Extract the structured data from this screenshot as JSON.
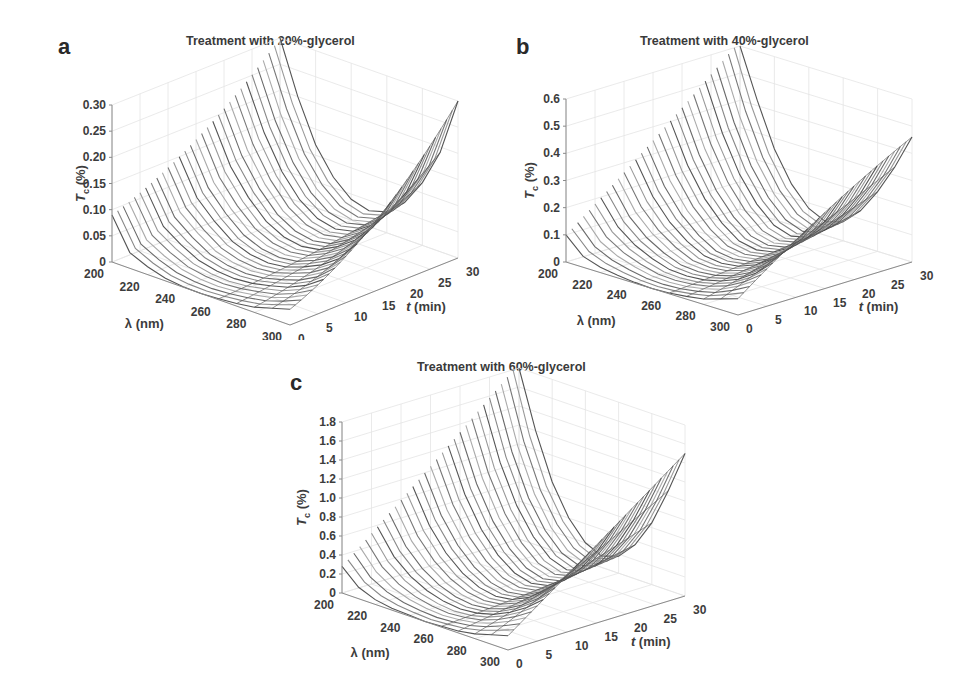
{
  "panels": [
    {
      "letter": "a",
      "title": "Treatment with 20%-glycerol",
      "zticks": [
        "0",
        "0.05",
        "0.10",
        "0.15",
        "0.20",
        "0.25",
        "0.30"
      ],
      "zmax": 0.3
    },
    {
      "letter": "b",
      "title": "Treatment with 40%-glycerol",
      "zticks": [
        "0",
        "0.1",
        "0.2",
        "0.3",
        "0.4",
        "0.5",
        "0.6"
      ],
      "zmax": 0.6
    },
    {
      "letter": "c",
      "title": "Treatment with 60%-glycerol",
      "zticks": [
        "0",
        "0.2",
        "0.4",
        "0.6",
        "0.8",
        "1.0",
        "1.2",
        "1.4",
        "1.6",
        "1.8"
      ],
      "zmax": 1.8
    }
  ],
  "axes": {
    "xlabel": "λ (nm)",
    "ylabel": "t (min)",
    "zlabel": "T c (%)",
    "xticks": [
      "200",
      "220",
      "240",
      "260",
      "280",
      "300"
    ],
    "yticks": [
      "0",
      "5",
      "10",
      "15",
      "20",
      "25",
      "30"
    ]
  },
  "chart_data": [
    {
      "type": "surface",
      "title": "Treatment with 20%-glycerol",
      "xlabel": "λ (nm)",
      "ylabel": "t (min)",
      "zlabel": "Tc (%)",
      "xlim": [
        200,
        300
      ],
      "ylim": [
        0,
        30
      ],
      "zlim": [
        0,
        0.3
      ],
      "description": "Mesh lines of Tc vs wavelength for t = 0..30 min; U-shaped curves with minimum near 240-250 nm, edges rising with time; max ~0.30% at 300 nm, ~0.30% at 200 nm, t=30",
      "x": [
        200,
        210,
        220,
        230,
        240,
        250,
        260,
        270,
        280,
        290,
        300
      ],
      "series": [
        {
          "name": "t=0",
          "values": [
            0.09,
            0.03,
            0.015,
            0.005,
            0.001,
            0.0,
            0.002,
            0.005,
            0.01,
            0.02,
            0.03
          ]
        },
        {
          "name": "t=15",
          "values": [
            0.17,
            0.1,
            0.06,
            0.03,
            0.015,
            0.01,
            0.015,
            0.03,
            0.05,
            0.08,
            0.13
          ]
        },
        {
          "name": "t=30",
          "values": [
            0.3,
            0.2,
            0.12,
            0.07,
            0.04,
            0.03,
            0.04,
            0.07,
            0.12,
            0.19,
            0.3
          ]
        }
      ]
    },
    {
      "type": "surface",
      "title": "Treatment with 40%-glycerol",
      "xlabel": "λ (nm)",
      "ylabel": "t (min)",
      "zlabel": "Tc (%)",
      "xlim": [
        200,
        300
      ],
      "ylim": [
        0,
        30
      ],
      "zlim": [
        0,
        0.6
      ],
      "x": [
        200,
        210,
        220,
        230,
        240,
        250,
        260,
        270,
        280,
        290,
        300
      ],
      "series": [
        {
          "name": "t=0",
          "values": [
            0.1,
            0.04,
            0.02,
            0.01,
            0.003,
            0.0,
            0.003,
            0.01,
            0.02,
            0.04,
            0.06
          ]
        },
        {
          "name": "t=15",
          "values": [
            0.35,
            0.22,
            0.13,
            0.07,
            0.03,
            0.02,
            0.03,
            0.06,
            0.11,
            0.18,
            0.28
          ]
        },
        {
          "name": "t=30",
          "values": [
            0.62,
            0.42,
            0.26,
            0.15,
            0.08,
            0.05,
            0.07,
            0.13,
            0.22,
            0.33,
            0.46
          ]
        }
      ]
    },
    {
      "type": "surface",
      "title": "Treatment with 60%-glycerol",
      "xlabel": "λ (nm)",
      "ylabel": "t (min)",
      "zlabel": "Tc (%)",
      "xlim": [
        200,
        300
      ],
      "ylim": [
        0,
        30
      ],
      "zlim": [
        0,
        1.8
      ],
      "x": [
        200,
        210,
        220,
        230,
        240,
        250,
        260,
        270,
        280,
        290,
        300
      ],
      "series": [
        {
          "name": "t=0",
          "values": [
            0.28,
            0.12,
            0.05,
            0.02,
            0.01,
            0.0,
            0.01,
            0.02,
            0.05,
            0.1,
            0.15
          ]
        },
        {
          "name": "t=15",
          "values": [
            1.05,
            0.65,
            0.38,
            0.2,
            0.09,
            0.05,
            0.08,
            0.18,
            0.34,
            0.55,
            0.82
          ]
        },
        {
          "name": "t=30",
          "values": [
            1.85,
            1.2,
            0.72,
            0.4,
            0.2,
            0.12,
            0.18,
            0.36,
            0.65,
            1.05,
            1.5
          ]
        }
      ]
    }
  ]
}
